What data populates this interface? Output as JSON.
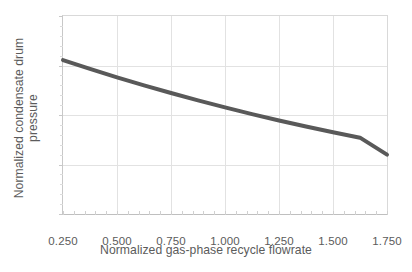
{
  "chart_data": {
    "type": "line",
    "title": "",
    "xlabel": "Normalized gas-phase recycle flowrate",
    "ylabel": "Normalized condensate drum pressure",
    "xlim": [
      0.25,
      1.75
    ],
    "ylim": [
      0.9,
      1.1
    ],
    "grid": true,
    "legend": "none",
    "line_color": "#595959",
    "line_width_px": 4,
    "xticks": [
      "0.250",
      "0.500",
      "0.750",
      "1.000",
      "1.250",
      "1.500",
      "1.750"
    ],
    "xtick_values": [
      0.25,
      0.5,
      0.75,
      1.0,
      1.25,
      1.5,
      1.75
    ],
    "yticks": [
      "0.900",
      "0.950",
      "1.000",
      "1.050",
      "1.100"
    ],
    "ytick_values": [
      0.9,
      0.95,
      1.0,
      1.05,
      1.1
    ],
    "series": [
      {
        "name": "Normalized condensate drum pressure",
        "x": [
          0.25,
          0.375,
          0.5,
          0.625,
          0.75,
          0.875,
          1.0,
          1.125,
          1.25,
          1.375,
          1.5,
          1.625,
          1.75
        ],
        "values": [
          1.0555,
          1.0465,
          1.038,
          1.03,
          1.0222,
          1.0148,
          1.0077,
          1.0009,
          0.9945,
          0.9884,
          0.9826,
          0.9771,
          0.96
        ]
      }
    ]
  },
  "axes": {
    "x_title": "Normalized gas-phase recycle flowrate",
    "y_title": "Normalized condensate drum pressure"
  }
}
